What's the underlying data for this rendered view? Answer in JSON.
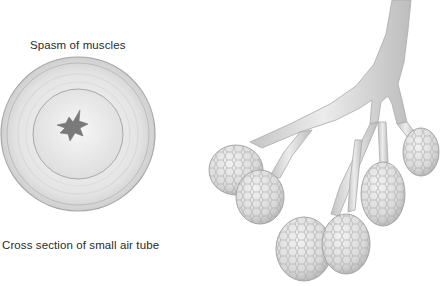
{
  "figure": {
    "left_panel": {
      "top_label": "Spasm of muscles",
      "bottom_label": "Cross section of small air tube"
    },
    "right_panel": {
      "subject": "bronchiole-branches-with-alveolar-clusters",
      "cluster_count": 6
    },
    "colors": {
      "background": "#ffffff",
      "tissue_light": "#e8e8e8",
      "tissue_mid": "#cfcfcf",
      "tissue_outline": "#9a9a9a",
      "lumen": "#7a7a7a",
      "text": "#2a2a2a"
    }
  }
}
